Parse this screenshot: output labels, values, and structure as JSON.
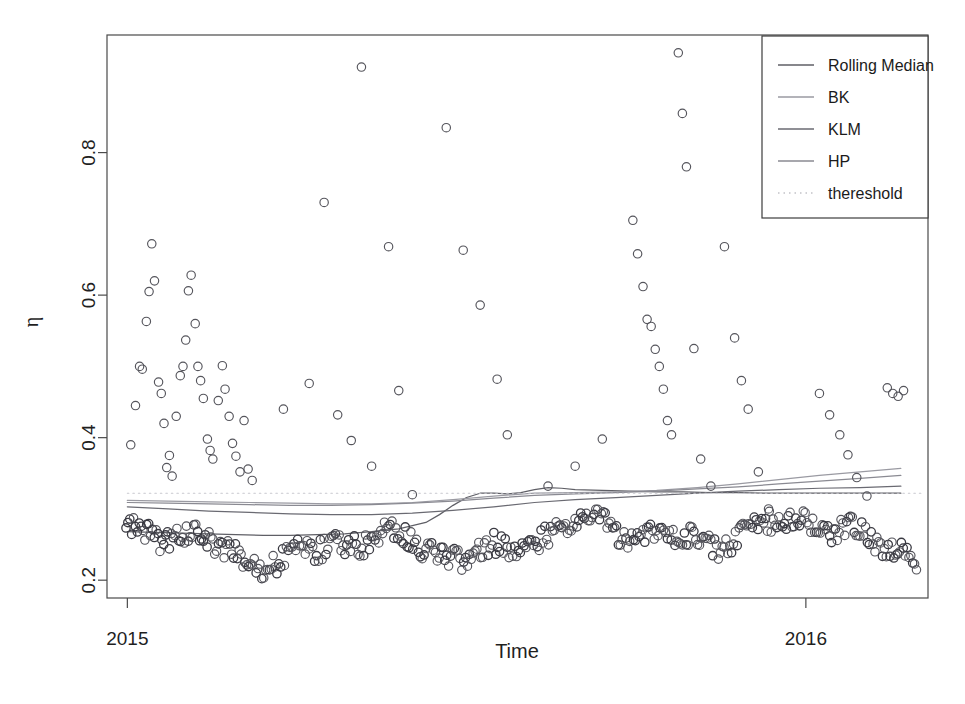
{
  "chart_data": {
    "type": "scatter",
    "title": "",
    "xlabel": "Time",
    "ylabel": "η",
    "xlim": [
      2014.97,
      2016.18
    ],
    "ylim": [
      0.175,
      0.965
    ],
    "xticks": [
      2015,
      2016
    ],
    "xtick_labels": [
      "2015",
      "2016"
    ],
    "yticks": [
      0.2,
      0.4,
      0.6,
      0.8
    ],
    "ytick_labels": [
      "0.2",
      "0.4",
      "0.6",
      "0.8"
    ],
    "grid": false,
    "legend_position": "top-right",
    "legend_entries": [
      {
        "label": "Rolling Median",
        "style": "solid",
        "color": "#5f5f66"
      },
      {
        "label": "BK",
        "style": "solid",
        "color": "#9a9aa2"
      },
      {
        "label": "KLM",
        "style": "solid",
        "color": "#6a6a72"
      },
      {
        "label": "HP",
        "style": "solid",
        "color": "#8a8a92"
      },
      {
        "label": "thereshold",
        "style": "dotted",
        "color": "#c2c2c8"
      }
    ],
    "marker": {
      "shape": "open-circle",
      "radius_px": 4.2,
      "color": "#55555c"
    },
    "series": [
      {
        "name": "Rolling Median",
        "color": "#5f5f66",
        "style": "solid",
        "x": [
          2015.0,
          2015.04,
          2015.08,
          2015.12,
          2015.16,
          2015.2,
          2015.24,
          2015.28,
          2015.32,
          2015.36,
          2015.4,
          2015.44,
          2015.46,
          2015.48,
          2015.5,
          2015.52,
          2015.54,
          2015.56,
          2015.58,
          2015.6,
          2015.62,
          2015.64,
          2015.66,
          2015.7,
          2015.74,
          2015.78,
          2015.82,
          2015.86,
          2015.9,
          2015.94,
          2015.98,
          2016.02,
          2016.06,
          2016.1,
          2016.14
        ],
        "y": [
          0.268,
          0.267,
          0.266,
          0.265,
          0.264,
          0.263,
          0.263,
          0.264,
          0.265,
          0.268,
          0.272,
          0.281,
          0.292,
          0.305,
          0.316,
          0.322,
          0.322,
          0.321,
          0.323,
          0.327,
          0.33,
          0.329,
          0.327,
          0.326,
          0.325,
          0.324,
          0.324,
          0.323,
          0.323,
          0.322,
          0.322,
          0.322,
          0.322,
          0.322,
          0.322
        ]
      },
      {
        "name": "BK",
        "color": "#9a9aa2",
        "style": "solid",
        "x": [
          2015.0,
          2015.06,
          2015.12,
          2015.18,
          2015.24,
          2015.3,
          2015.36,
          2015.42,
          2015.48,
          2015.54,
          2015.6,
          2015.66,
          2015.72,
          2015.78,
          2015.84,
          2015.9,
          2015.96,
          2016.02,
          2016.08,
          2016.14
        ],
        "y": [
          0.312,
          0.311,
          0.31,
          0.309,
          0.308,
          0.307,
          0.307,
          0.309,
          0.313,
          0.318,
          0.322,
          0.323,
          0.324,
          0.326,
          0.33,
          0.335,
          0.341,
          0.347,
          0.352,
          0.357
        ]
      },
      {
        "name": "KLM",
        "color": "#6a6a72",
        "style": "solid",
        "x": [
          2015.0,
          2015.06,
          2015.12,
          2015.18,
          2015.24,
          2015.3,
          2015.36,
          2015.42,
          2015.48,
          2015.54,
          2015.6,
          2015.66,
          2015.72,
          2015.78,
          2015.84,
          2015.9,
          2015.96,
          2016.02,
          2016.08,
          2016.14
        ],
        "y": [
          0.303,
          0.3,
          0.297,
          0.295,
          0.293,
          0.292,
          0.292,
          0.294,
          0.298,
          0.303,
          0.309,
          0.313,
          0.316,
          0.319,
          0.322,
          0.325,
          0.327,
          0.329,
          0.33,
          0.332
        ]
      },
      {
        "name": "HP",
        "color": "#8a8a92",
        "style": "solid",
        "x": [
          2015.0,
          2015.06,
          2015.12,
          2015.18,
          2015.24,
          2015.3,
          2015.36,
          2015.42,
          2015.48,
          2015.54,
          2015.6,
          2015.66,
          2015.72,
          2015.78,
          2015.84,
          2015.9,
          2015.96,
          2016.02,
          2016.08,
          2016.14
        ],
        "y": [
          0.309,
          0.308,
          0.307,
          0.306,
          0.305,
          0.305,
          0.306,
          0.308,
          0.311,
          0.315,
          0.319,
          0.321,
          0.323,
          0.325,
          0.328,
          0.331,
          0.335,
          0.339,
          0.343,
          0.347
        ]
      },
      {
        "name": "thereshold",
        "color": "#c8c8ce",
        "style": "dotted",
        "x": [
          2015.0,
          2016.17
        ],
        "y": [
          0.322,
          0.322
        ]
      }
    ],
    "scatter_points": [
      [
        2015.005,
        0.39
      ],
      [
        2015.012,
        0.445
      ],
      [
        2015.018,
        0.5
      ],
      [
        2015.022,
        0.496
      ],
      [
        2015.028,
        0.563
      ],
      [
        2015.032,
        0.605
      ],
      [
        2015.036,
        0.672
      ],
      [
        2015.04,
        0.62
      ],
      [
        2015.046,
        0.478
      ],
      [
        2015.05,
        0.462
      ],
      [
        2015.054,
        0.42
      ],
      [
        2015.058,
        0.358
      ],
      [
        2015.062,
        0.375
      ],
      [
        2015.066,
        0.346
      ],
      [
        2015.072,
        0.43
      ],
      [
        2015.078,
        0.487
      ],
      [
        2015.082,
        0.5
      ],
      [
        2015.086,
        0.537
      ],
      [
        2015.09,
        0.606
      ],
      [
        2015.094,
        0.628
      ],
      [
        2015.1,
        0.56
      ],
      [
        2015.104,
        0.5
      ],
      [
        2015.108,
        0.48
      ],
      [
        2015.112,
        0.455
      ],
      [
        2015.118,
        0.398
      ],
      [
        2015.122,
        0.382
      ],
      [
        2015.126,
        0.37
      ],
      [
        2015.134,
        0.452
      ],
      [
        2015.14,
        0.501
      ],
      [
        2015.144,
        0.468
      ],
      [
        2015.15,
        0.43
      ],
      [
        2015.155,
        0.392
      ],
      [
        2015.16,
        0.374
      ],
      [
        2015.166,
        0.352
      ],
      [
        2015.172,
        0.424
      ],
      [
        2015.178,
        0.356
      ],
      [
        2015.184,
        0.34
      ],
      [
        2015.23,
        0.44
      ],
      [
        2015.268,
        0.476
      ],
      [
        2015.29,
        0.73
      ],
      [
        2015.31,
        0.432
      ],
      [
        2015.33,
        0.396
      ],
      [
        2015.345,
        0.92
      ],
      [
        2015.36,
        0.36
      ],
      [
        2015.385,
        0.668
      ],
      [
        2015.4,
        0.466
      ],
      [
        2015.42,
        0.32
      ],
      [
        2015.47,
        0.835
      ],
      [
        2015.495,
        0.663
      ],
      [
        2015.52,
        0.586
      ],
      [
        2015.545,
        0.482
      ],
      [
        2015.56,
        0.404
      ],
      [
        2015.62,
        0.332
      ],
      [
        2015.66,
        0.36
      ],
      [
        2015.7,
        0.398
      ],
      [
        2015.745,
        0.705
      ],
      [
        2015.752,
        0.658
      ],
      [
        2015.76,
        0.612
      ],
      [
        2015.766,
        0.566
      ],
      [
        2015.772,
        0.556
      ],
      [
        2015.778,
        0.524
      ],
      [
        2015.784,
        0.5
      ],
      [
        2015.79,
        0.468
      ],
      [
        2015.796,
        0.424
      ],
      [
        2015.802,
        0.404
      ],
      [
        2015.812,
        0.94
      ],
      [
        2015.818,
        0.855
      ],
      [
        2015.824,
        0.78
      ],
      [
        2015.835,
        0.525
      ],
      [
        2015.845,
        0.37
      ],
      [
        2015.86,
        0.332
      ],
      [
        2015.88,
        0.668
      ],
      [
        2015.895,
        0.54
      ],
      [
        2015.905,
        0.48
      ],
      [
        2015.915,
        0.44
      ],
      [
        2015.93,
        0.352
      ],
      [
        2015.945,
        0.3
      ],
      [
        2016.02,
        0.462
      ],
      [
        2016.035,
        0.432
      ],
      [
        2016.05,
        0.404
      ],
      [
        2016.062,
        0.376
      ],
      [
        2016.075,
        0.344
      ],
      [
        2016.09,
        0.318
      ],
      [
        2016.12,
        0.47
      ],
      [
        2016.128,
        0.462
      ],
      [
        2016.136,
        0.458
      ],
      [
        2016.144,
        0.466
      ]
    ],
    "band_description": "Dense lower band of open circles oscillating between η ≈ 0.205 and η ≈ 0.295 across the whole time range",
    "band_points_count": 420
  },
  "figure": {
    "width": 965,
    "height": 704,
    "background": "#ffffff",
    "plot_frame": {
      "left": 107,
      "right": 928,
      "top": 35,
      "bottom": 598
    }
  }
}
